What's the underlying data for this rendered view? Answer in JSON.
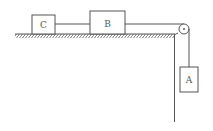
{
  "diagram": {
    "blocks": [
      {
        "id": "C",
        "label": "C"
      },
      {
        "id": "B",
        "label": "B"
      },
      {
        "id": "A",
        "label": "A"
      }
    ],
    "colors": {
      "line": "#555555",
      "background": "#ffffff"
    }
  }
}
